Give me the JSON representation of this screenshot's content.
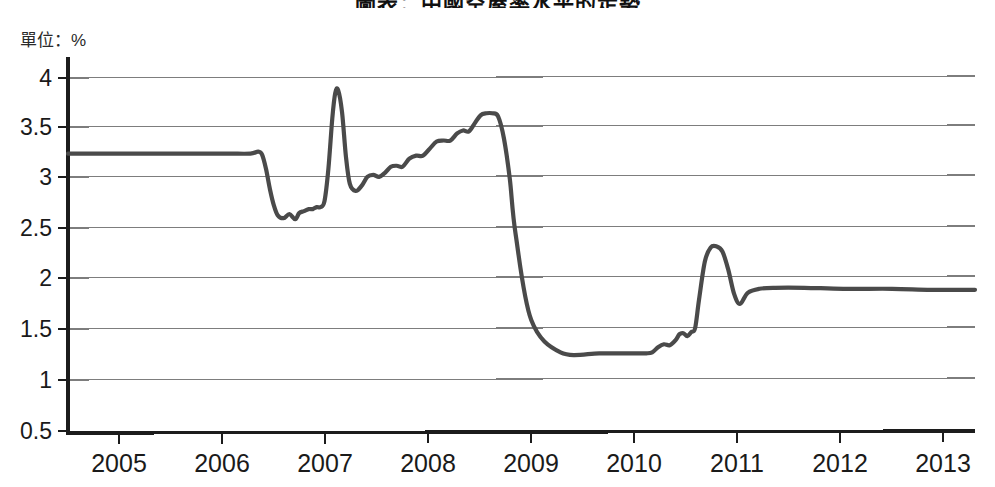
{
  "chart": {
    "title": "圖表：中國空屋率水平的走勢",
    "unit_label": "單位：%"
  },
  "chart_data": {
    "type": "line",
    "title": "圖表：中國空屋率水平的走勢",
    "subtitle": "單位：%",
    "xlabel": "",
    "ylabel": "單位：%",
    "xlim": [
      2004.55,
      2013.85
    ],
    "ylim": [
      0.5,
      4.2
    ],
    "ytick_labels": [
      "0.5",
      "1",
      "1.5",
      "2",
      "2.5",
      "3",
      "3.5",
      "4"
    ],
    "ytick_values": [
      0.5,
      1,
      1.5,
      2,
      2.5,
      3,
      3.5,
      4
    ],
    "xtick_labels": [
      "2005",
      "2006",
      "2007",
      "2008",
      "2009",
      "2010",
      "2011",
      "2012",
      "2013"
    ],
    "xtick_values": [
      2005,
      2006,
      2007,
      2008,
      2009,
      2010,
      2011,
      2012,
      2013
    ],
    "grid": "horizontal",
    "legend": "none",
    "line_color": "#4a4a4a",
    "series": [
      {
        "name": "rate",
        "x": [
          2004.55,
          2004.9,
          2005.2,
          2005.5,
          2005.9,
          2006.2,
          2006.42,
          2006.5,
          2006.54,
          2006.58,
          2006.62,
          2006.66,
          2006.7,
          2006.76,
          2006.82,
          2006.88,
          2006.92,
          2006.97,
          2007.02,
          2007.06,
          2007.1,
          2007.14,
          2007.18,
          2007.22,
          2007.26,
          2007.29,
          2007.32,
          2007.36,
          2007.4,
          2007.44,
          2007.5,
          2007.56,
          2007.62,
          2007.68,
          2007.74,
          2007.8,
          2007.86,
          2007.92,
          2007.98,
          2008.05,
          2008.12,
          2008.19,
          2008.26,
          2008.33,
          2008.4,
          2008.47,
          2008.54,
          2008.6,
          2008.66,
          2008.72,
          2008.78,
          2008.84,
          2008.9,
          2008.96,
          2009.02,
          2009.08,
          2009.14,
          2009.3,
          2009.6,
          2010.0,
          2010.3,
          2010.42,
          2010.48,
          2010.54,
          2010.6,
          2010.66,
          2010.72,
          2010.78,
          2010.82,
          2010.86,
          2010.9,
          2010.94,
          2010.98,
          2011.02,
          2011.08,
          2011.14,
          2011.2,
          2011.26,
          2011.32,
          2011.38,
          2011.44,
          2011.52,
          2011.64,
          2011.8,
          2012.1,
          2012.5,
          2013.0,
          2013.4,
          2013.85
        ],
        "y": [
          3.25,
          3.25,
          3.25,
          3.25,
          3.25,
          3.25,
          3.25,
          3.27,
          3.24,
          3.1,
          2.9,
          2.74,
          2.64,
          2.61,
          2.65,
          2.6,
          2.66,
          2.68,
          2.7,
          2.7,
          2.72,
          2.72,
          2.78,
          3.1,
          3.6,
          3.85,
          3.88,
          3.66,
          3.22,
          2.95,
          2.88,
          2.93,
          3.02,
          3.04,
          3.02,
          3.06,
          3.12,
          3.13,
          3.12,
          3.2,
          3.23,
          3.23,
          3.3,
          3.37,
          3.38,
          3.38,
          3.45,
          3.48,
          3.47,
          3.55,
          3.63,
          3.65,
          3.65,
          3.62,
          3.4,
          3.0,
          2.45,
          1.6,
          1.28,
          1.27,
          1.27,
          1.27,
          1.27,
          1.28,
          1.33,
          1.36,
          1.35,
          1.4,
          1.46,
          1.47,
          1.44,
          1.48,
          1.52,
          1.8,
          2.18,
          2.32,
          2.33,
          2.28,
          2.1,
          1.86,
          1.76,
          1.87,
          1.91,
          1.92,
          1.92,
          1.91,
          1.91,
          1.9,
          1.9
        ]
      }
    ],
    "annotations": [
      {
        "label": "flat-plateau-2005-2006",
        "value": 3.25
      },
      {
        "label": "spike-peak-2007",
        "value": 3.88
      },
      {
        "label": "peak-2008",
        "value": 3.65
      },
      {
        "label": "trough-plateau-2009-2010",
        "value": 1.27
      },
      {
        "label": "spike-peak-2011",
        "value": 2.33
      },
      {
        "label": "final-level-2013",
        "value": 1.9
      }
    ]
  }
}
